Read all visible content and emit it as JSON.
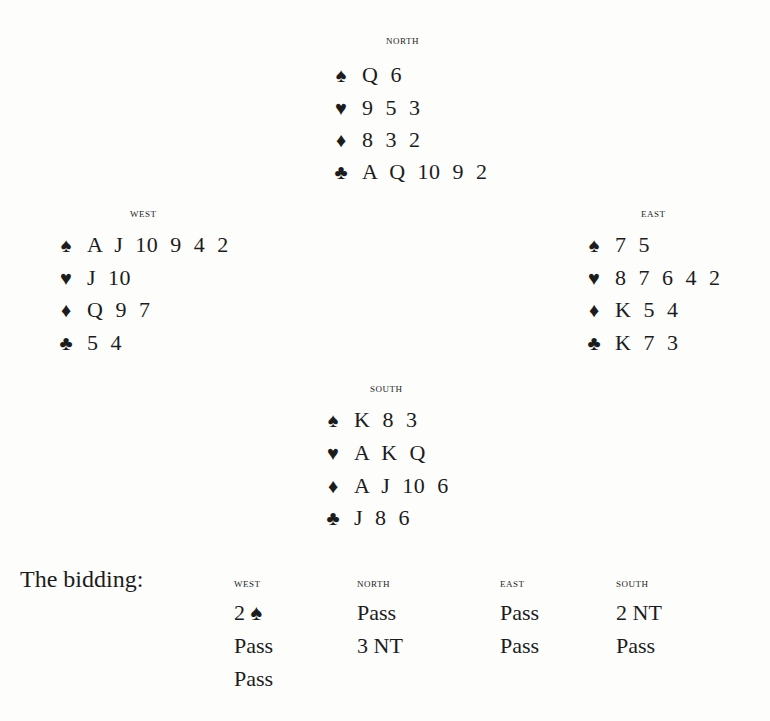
{
  "hands": {
    "north": {
      "label": "NORTH",
      "spades": "Q 6",
      "hearts": "9 5 3",
      "diamonds": "8 3 2",
      "clubs": "A Q 10 9 2"
    },
    "west": {
      "label": "WEST",
      "spades": "A J 10 9 4 2",
      "hearts": "J 10",
      "diamonds": "Q 9 7",
      "clubs": "5 4"
    },
    "east": {
      "label": "EAST",
      "spades": "7 5",
      "hearts": "8 7 6 4 2",
      "diamonds": "K 5 4",
      "clubs": "K 7 3"
    },
    "south": {
      "label": "SOUTH",
      "spades": "K 8 3",
      "hearts": "A K Q",
      "diamonds": "A J 10 6",
      "clubs": "J 8 6"
    }
  },
  "suit_icons": {
    "spades": "♠",
    "hearts": "♥",
    "diamonds": "♦",
    "clubs": "♣"
  },
  "bidding": {
    "title": "The bidding:",
    "columns": [
      {
        "header": "WEST",
        "bids": [
          "2 ♠",
          "Pass",
          "Pass"
        ]
      },
      {
        "header": "NORTH",
        "bids": [
          "Pass",
          "3 NT"
        ]
      },
      {
        "header": "EAST",
        "bids": [
          "Pass",
          "Pass"
        ]
      },
      {
        "header": "SOUTH",
        "bids": [
          "2 NT",
          "Pass"
        ]
      }
    ]
  }
}
